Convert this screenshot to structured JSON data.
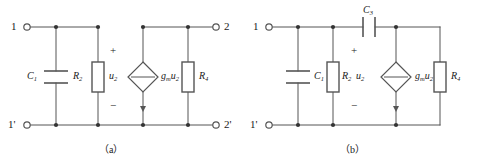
{
  "figure": {
    "type": "circuit-diagram",
    "width": 482,
    "height": 163,
    "background": "#ffffff",
    "line_color": "#555555",
    "text_color": "#1a1a1a"
  },
  "circuit_a": {
    "caption": "（a）",
    "terminals": {
      "top_left": "1",
      "bottom_left": "1'",
      "top_right": "2",
      "bottom_right": "2'"
    },
    "components": {
      "capacitor_c1": "C",
      "capacitor_c1_sub": "1",
      "resistor_r2": "R",
      "resistor_r2_sub": "2",
      "voltage_u2": "u",
      "voltage_u2_sub": "2",
      "source_gm": "g",
      "source_gm_sub": "m",
      "source_u2": "u",
      "source_u2_sub": "2",
      "resistor_r4": "R",
      "resistor_r4_sub": "4"
    },
    "polarity": {
      "plus": "+",
      "minus": "−"
    }
  },
  "circuit_b": {
    "caption": "（b）",
    "terminals": {
      "top_left": "1",
      "bottom_left": "1'"
    },
    "components": {
      "capacitor_c3": "C",
      "capacitor_c3_sub": "3",
      "capacitor_c1": "C",
      "capacitor_c1_sub": "1",
      "resistor_r2": "R",
      "resistor_r2_sub": "2",
      "voltage_u2": "u",
      "voltage_u2_sub": "2",
      "source_gm": "g",
      "source_gm_sub": "m",
      "source_u2": "u",
      "source_u2_sub": "2",
      "resistor_r4": "R",
      "resistor_r4_sub": "4"
    },
    "polarity": {
      "plus": "+",
      "minus": "−"
    }
  }
}
